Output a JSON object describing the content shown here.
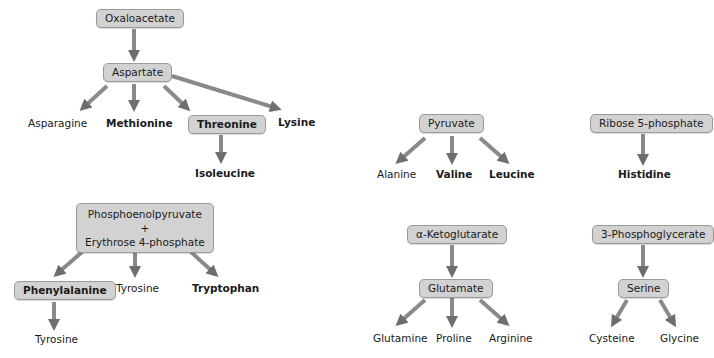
{
  "diagram": {
    "colors": {
      "box_fill": "#d2d2d2",
      "box_border": "#9a9a9a",
      "arrow": "#7a7a7a",
      "text": "#1a1a1a"
    },
    "groups": [
      {
        "name": "oxaloacetate-family",
        "nodes": {
          "oxaloacetate": "Oxaloacetate",
          "aspartate": "Aspartate",
          "asparagine": "Asparagine",
          "methionine": "Methionine",
          "threonine": "Threonine",
          "lysine": "Lysine",
          "isoleucine": "Isoleucine"
        }
      },
      {
        "name": "pep-e4p-family",
        "nodes": {
          "pep_line1": "Phosphoenolpyruvate",
          "pep_plus": "+",
          "pep_line2": "Erythrose 4-phosphate",
          "phenylalanine": "Phenylalanine",
          "tyrosine_a": "Tyrosine",
          "tryptophan": "Tryptophan",
          "tyrosine_b": "Tyrosine"
        }
      },
      {
        "name": "pyruvate-family",
        "nodes": {
          "pyruvate": "Pyruvate",
          "alanine": "Alanine",
          "valine": "Valine",
          "leucine": "Leucine"
        }
      },
      {
        "name": "ribose-family",
        "nodes": {
          "ribose": "Ribose 5-phosphate",
          "histidine": "Histidine"
        }
      },
      {
        "name": "ketoglutarate-family",
        "nodes": {
          "ketoglutarate": "α-Ketoglutarate",
          "glutamate": "Glutamate",
          "glutamine": "Glutamine",
          "proline": "Proline",
          "arginine": "Arginine"
        }
      },
      {
        "name": "phosphoglycerate-family",
        "nodes": {
          "phosphoglycerate": "3-Phosphoglycerate",
          "serine": "Serine",
          "cysteine": "Cysteine",
          "glycine": "Glycine"
        }
      }
    ]
  }
}
